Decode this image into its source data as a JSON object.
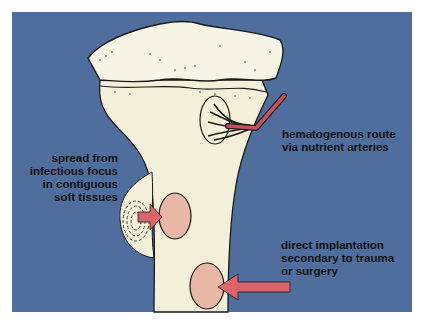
{
  "diagram": {
    "colors": {
      "background": "#4f6e9e",
      "bone": "#f3efd8",
      "cartilage": "#f7f4e6",
      "lesion": "#e9b7a5",
      "arrow": "#d9646a",
      "artery": "#c9505a",
      "outline": "#1a1a1a"
    },
    "labels": {
      "hematogenous": [
        "hematogenous route",
        "via nutrient arteries"
      ],
      "spread": [
        "spread from",
        "infectious focus",
        "in contiguous",
        "soft tissues"
      ],
      "direct": [
        "direct implantation",
        "secondary to trauma",
        "or surgery"
      ]
    }
  }
}
